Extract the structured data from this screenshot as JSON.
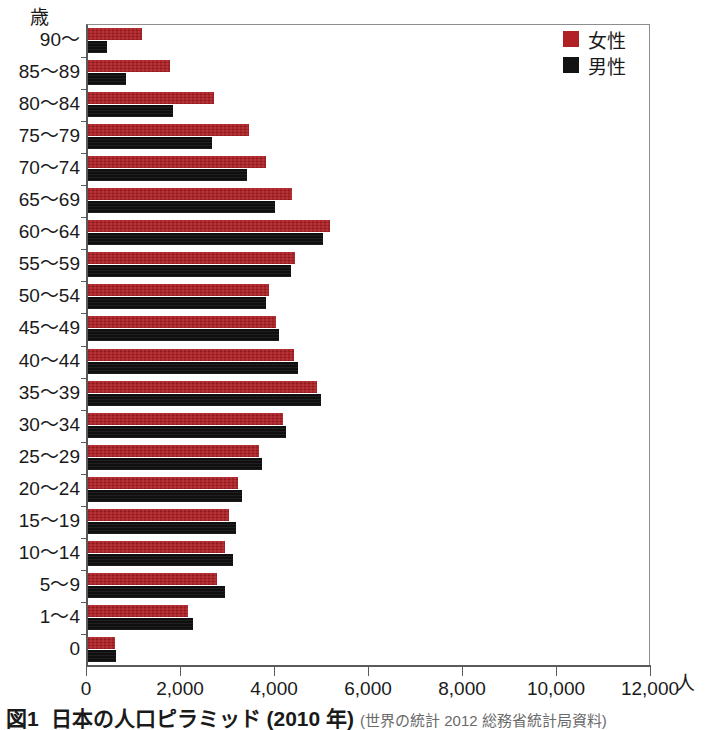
{
  "figure": {
    "caption_number": "図1",
    "caption_title": "日本の人口ピラミッド (2010 年)",
    "caption_source": "(世界の統計 2012 総務省統計局資料)",
    "y_unit": "歳",
    "x_unit": "人"
  },
  "legend": {
    "position": "top-right",
    "items": [
      {
        "label": "女性",
        "color": "#b02025",
        "key": "female"
      },
      {
        "label": "男性",
        "color": "#131313",
        "key": "male"
      }
    ]
  },
  "chart_data": {
    "type": "bar",
    "orientation": "horizontal",
    "title": "日本の人口ピラミッド (2010 年)",
    "xlabel": "人",
    "ylabel": "歳",
    "xlim": [
      0,
      12000
    ],
    "xticks": [
      0,
      2000,
      4000,
      6000,
      8000,
      10000,
      12000
    ],
    "xticklabels": [
      "0",
      "2,000",
      "4,000",
      "6,000",
      "8,000",
      "10,000",
      "12,000"
    ],
    "grid": false,
    "legend_position": "upper right",
    "categories": [
      "90〜",
      "85〜89",
      "80〜84",
      "75〜79",
      "70〜74",
      "65〜69",
      "60〜64",
      "55〜59",
      "50〜54",
      "45〜49",
      "40〜44",
      "35〜39",
      "30〜34",
      "25〜29",
      "20〜24",
      "15〜19",
      "10〜14",
      "5〜9",
      "1〜4",
      "0"
    ],
    "series": [
      {
        "name": "女性",
        "key": "female",
        "color": "#b02025",
        "values": [
          1150,
          1750,
          2680,
          3430,
          3790,
          4340,
          5150,
          4410,
          3850,
          4000,
          4380,
          4870,
          4150,
          3640,
          3190,
          3000,
          2910,
          2750,
          2120,
          570
        ]
      },
      {
        "name": "男性",
        "key": "male",
        "color": "#131313",
        "values": [
          400,
          810,
          1810,
          2640,
          3380,
          3980,
          5000,
          4320,
          3780,
          4070,
          4470,
          4960,
          4220,
          3700,
          3280,
          3150,
          3080,
          2920,
          2230,
          600
        ]
      }
    ]
  }
}
